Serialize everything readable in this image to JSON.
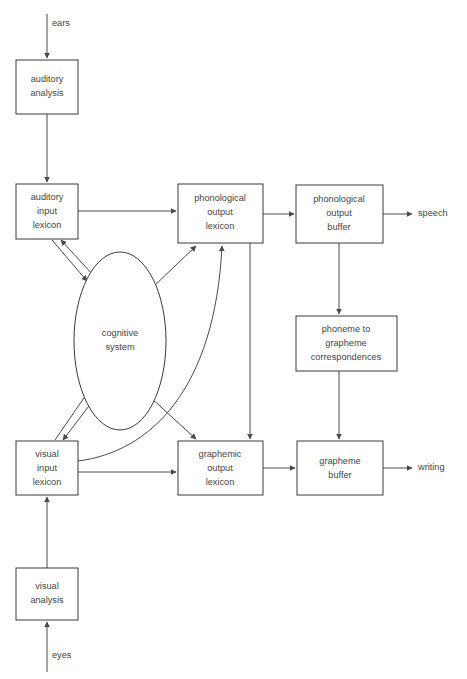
{
  "diagram": {
    "colors": {
      "background": "#ffffff",
      "box_stroke": "#3a3a3a",
      "edge_stroke": "#4a4a4a",
      "text": "#454545"
    },
    "nodes": [
      {
        "id": "auditory-analysis",
        "label": "auditory\nanalysis",
        "shape": "rect",
        "x": 16,
        "y": 60,
        "w": 62,
        "h": 54
      },
      {
        "id": "auditory-input-lexicon",
        "label": "auditory\ninput\nlexicon",
        "shape": "rect",
        "x": 16,
        "y": 184,
        "w": 62,
        "h": 55
      },
      {
        "id": "phonological-output-lexicon",
        "label": "phonological\noutput\nlexicon",
        "shape": "rect",
        "x": 178,
        "y": 184,
        "w": 85,
        "h": 59
      },
      {
        "id": "phonological-output-buffer",
        "label": "phonological\noutput\nbuffer",
        "shape": "rect",
        "x": 296,
        "y": 185,
        "w": 87,
        "h": 58
      },
      {
        "id": "cognitive-system",
        "label": "cognitive\nsystem",
        "shape": "ellipse",
        "cx": 120,
        "cy": 341,
        "rx": 46,
        "ry": 89
      },
      {
        "id": "phoneme-to-grapheme",
        "label": "phoneme to\ngrapheme\ncorrespondences",
        "shape": "rect",
        "x": 296,
        "y": 316,
        "w": 101,
        "h": 55
      },
      {
        "id": "visual-input-lexicon",
        "label": "visual\ninput\nlexicon",
        "shape": "rect",
        "x": 16,
        "y": 441,
        "w": 62,
        "h": 54
      },
      {
        "id": "graphemic-output-lexicon",
        "label": "graphemic\noutput\nlexicon",
        "shape": "rect",
        "x": 178,
        "y": 441,
        "w": 85,
        "h": 54
      },
      {
        "id": "grapheme-buffer",
        "label": "grapheme\nbuffer",
        "shape": "rect",
        "x": 297,
        "y": 441,
        "w": 86,
        "h": 54
      },
      {
        "id": "visual-analysis",
        "label": "visual\nanalysis",
        "shape": "rect",
        "x": 16,
        "y": 568,
        "w": 62,
        "h": 52
      }
    ],
    "io_labels": [
      {
        "id": "ears",
        "text": "ears",
        "x": 52,
        "y": 24
      },
      {
        "id": "speech",
        "text": "speech",
        "x": 418,
        "y": 214
      },
      {
        "id": "writing",
        "text": "writing",
        "x": 418,
        "y": 468
      },
      {
        "id": "eyes",
        "text": "eyes",
        "x": 52,
        "y": 656
      }
    ],
    "edges": [
      {
        "id": "ears-to-auditory-analysis",
        "from": "ears",
        "to": "auditory-analysis",
        "kind": "straight"
      },
      {
        "id": "auditory-analysis-to-auditory-input-lexicon",
        "from": "auditory-analysis",
        "to": "auditory-input-lexicon",
        "kind": "straight"
      },
      {
        "id": "auditory-input-to-phonological-output-lexicon",
        "from": "auditory-input-lexicon",
        "to": "phonological-output-lexicon",
        "kind": "straight"
      },
      {
        "id": "auditory-input-to-cognitive-system",
        "from": "auditory-input-lexicon",
        "to": "cognitive-system",
        "kind": "straight"
      },
      {
        "id": "cognitive-system-to-auditory-input",
        "from": "cognitive-system",
        "to": "auditory-input-lexicon",
        "kind": "straight"
      },
      {
        "id": "cognitive-system-to-phonological-output-lexicon",
        "from": "cognitive-system",
        "to": "phonological-output-lexicon",
        "kind": "straight"
      },
      {
        "id": "phonological-lexicon-to-phonological-buffer",
        "from": "phonological-output-lexicon",
        "to": "phonological-output-buffer",
        "kind": "straight"
      },
      {
        "id": "phonological-buffer-to-speech",
        "from": "phonological-output-buffer",
        "to": "speech",
        "kind": "straight"
      },
      {
        "id": "phonological-buffer-to-phoneme-grapheme",
        "from": "phonological-output-buffer",
        "to": "phoneme-to-grapheme",
        "kind": "straight"
      },
      {
        "id": "phoneme-grapheme-to-grapheme-buffer",
        "from": "phoneme-to-grapheme",
        "to": "grapheme-buffer",
        "kind": "straight"
      },
      {
        "id": "phonological-lexicon-to-graphemic-lexicon",
        "from": "phonological-output-lexicon",
        "to": "graphemic-output-lexicon",
        "kind": "straight"
      },
      {
        "id": "visual-input-to-cognitive-system",
        "from": "visual-input-lexicon",
        "to": "cognitive-system",
        "kind": "straight"
      },
      {
        "id": "cognitive-system-to-visual-input",
        "from": "cognitive-system",
        "to": "visual-input-lexicon",
        "kind": "straight"
      },
      {
        "id": "cognitive-system-to-graphemic-lexicon",
        "from": "cognitive-system",
        "to": "graphemic-output-lexicon",
        "kind": "straight"
      },
      {
        "id": "visual-input-to-phonological-output-lexicon",
        "from": "visual-input-lexicon",
        "to": "phonological-output-lexicon",
        "kind": "curved"
      },
      {
        "id": "visual-input-to-graphemic-lexicon",
        "from": "visual-input-lexicon",
        "to": "graphemic-output-lexicon",
        "kind": "straight"
      },
      {
        "id": "graphemic-lexicon-to-grapheme-buffer",
        "from": "graphemic-output-lexicon",
        "to": "grapheme-buffer",
        "kind": "straight"
      },
      {
        "id": "grapheme-buffer-to-writing",
        "from": "grapheme-buffer",
        "to": "writing",
        "kind": "straight"
      },
      {
        "id": "visual-analysis-to-visual-input-lexicon",
        "from": "visual-analysis",
        "to": "visual-input-lexicon",
        "kind": "straight"
      },
      {
        "id": "eyes-to-visual-analysis",
        "from": "eyes",
        "to": "visual-analysis",
        "kind": "straight"
      }
    ],
    "caption": ""
  }
}
